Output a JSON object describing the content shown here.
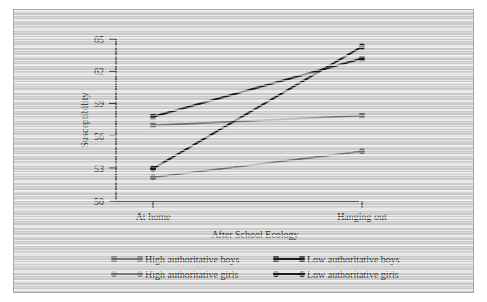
{
  "chart_data": {
    "type": "line",
    "title": "",
    "xlabel": "After School Ecology",
    "ylabel": "Susceptibility",
    "categories": [
      "At home",
      "Hanging out"
    ],
    "x": [
      0,
      1
    ],
    "ylim": [
      50,
      65
    ],
    "yticks": [
      50,
      53,
      56,
      59,
      62,
      65
    ],
    "ytick_labels": [
      "50",
      "53",
      "56",
      "59",
      "62",
      "65"
    ],
    "grid": false,
    "legend_position": "bottom",
    "series": [
      {
        "name": "High authoritative boys",
        "values": [
          57.0,
          57.9
        ],
        "color": "#6b6b6b",
        "marker": "square"
      },
      {
        "name": "Low authoritative boys",
        "values": [
          57.8,
          63.2
        ],
        "color": "#1a1a1a",
        "marker": "square"
      },
      {
        "name": "High authoritative girls",
        "values": [
          52.2,
          54.6
        ],
        "color": "#6b6b6b",
        "marker": "circle"
      },
      {
        "name": "Low authoritative girls",
        "values": [
          53.0,
          64.3
        ],
        "color": "#1a1a1a",
        "marker": "circle"
      }
    ]
  },
  "axes": {
    "y_title": "Susceptibility",
    "x_title": "After School Ecology",
    "y_tick_0": "50",
    "y_tick_1": "53",
    "y_tick_2": "56",
    "y_tick_3": "59",
    "y_tick_4": "62",
    "y_tick_5": "65",
    "x_cat_0": "At home",
    "x_cat_1": "Hanging out"
  },
  "legend": {
    "items": [
      {
        "label": "High authoritative boys",
        "color": "#6b6b6b",
        "marker": "square"
      },
      {
        "label": "Low authoritative boys",
        "color": "#1a1a1a",
        "marker": "square"
      },
      {
        "label": "High authoritative girls",
        "color": "#6b6b6b",
        "marker": "circle"
      },
      {
        "label": "Low authoritative girls",
        "color": "#1a1a1a",
        "marker": "circle"
      }
    ]
  }
}
